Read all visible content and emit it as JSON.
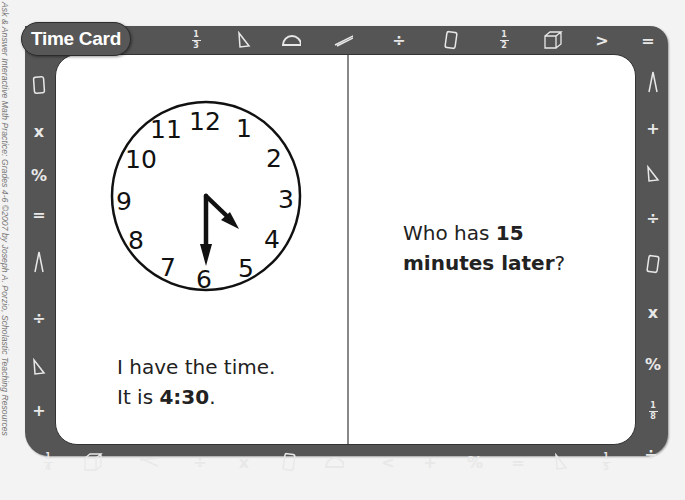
{
  "credit": "Ask & Answer Interactive Math Practice: Grades 4-6 ©2007 by Joseph A. Porzio, Scholastic Teaching Resources",
  "card": {
    "title": "Time Card",
    "left_panel": {
      "clock": {
        "numbers": [
          "12",
          "1",
          "2",
          "3",
          "4",
          "5",
          "6",
          "7",
          "8",
          "9",
          "10",
          "11"
        ],
        "hour_hand_points_to": "between 4 and 5",
        "minute_hand_points_to": "6",
        "time_shown": "4:30"
      },
      "line1": "I have the time.",
      "line2_prefix": "It is ",
      "line2_bold": "4:30",
      "line2_suffix": "."
    },
    "right_panel": {
      "line1_prefix": "Who has ",
      "line1_bold": "15",
      "line2_bold": "minutes later",
      "line2_suffix": "?"
    }
  },
  "frame_icons": {
    "top": [
      "1/3",
      "triangle",
      "protractor",
      "compass",
      "÷",
      "rectangle",
      "1/2",
      "cube",
      ">",
      "="
    ],
    "right": [
      "compass",
      "+",
      "triangle",
      "÷",
      "rectangle",
      "x",
      "%",
      "1/8",
      "÷"
    ],
    "bottom": [
      "1/4",
      "cube",
      "compass",
      "÷",
      "x",
      "rectangle",
      "protractor",
      "<",
      "+",
      "%",
      "=",
      "triangle",
      "1/5"
    ],
    "left": [
      "rectangle",
      "x",
      "%",
      "=",
      "compass",
      "÷",
      "triangle",
      "+"
    ]
  },
  "colors": {
    "frame": "#555555",
    "card_bg": "#ffffff",
    "text": "#222222"
  }
}
